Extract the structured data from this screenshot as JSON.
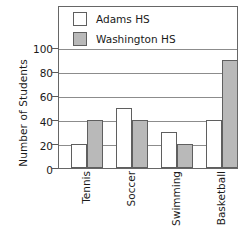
{
  "chart_data": {
    "type": "bar",
    "title": "",
    "subtitle": "",
    "xlabel": "",
    "ylabel": "Number of Students",
    "categories": [
      "Tennis",
      "Soccer",
      "Swimming",
      "Basketball"
    ],
    "series": [
      {
        "name": "Adams HS",
        "values": [
          20,
          50,
          30,
          40
        ],
        "color": "#ffffff"
      },
      {
        "name": "Washington HS",
        "values": [
          40,
          40,
          20,
          90
        ],
        "color": "#b9b9b9"
      }
    ],
    "ylim": [
      0,
      100
    ],
    "ytick_labels": [
      "0",
      "20",
      "40",
      "60",
      "80",
      "100"
    ],
    "ytick_values": [
      0,
      20,
      40,
      60,
      80,
      100
    ],
    "grid": true,
    "legend_position": "inside-top-left",
    "orientation": "vertical",
    "grouped": true
  },
  "axes": {
    "y_title": "Number of Students",
    "y_ticks": [
      {
        "label": "100",
        "value": 100
      },
      {
        "label": "80",
        "value": 80
      },
      {
        "label": "60",
        "value": 60
      },
      {
        "label": "40",
        "value": 40
      },
      {
        "label": "20",
        "value": 20
      },
      {
        "label": "0",
        "value": 0
      }
    ],
    "x_labels": [
      "Tennis",
      "Soccer",
      "Swimming",
      "Basketball"
    ]
  },
  "legend": {
    "entries": [
      {
        "label": "Adams HS",
        "swatch": "unfilled-square-swatch"
      },
      {
        "label": "Washington HS",
        "swatch": "filled-square-swatch"
      }
    ]
  },
  "colors": {
    "adams_fill": "#ffffff",
    "washington_fill": "#b9b9b9",
    "outline": "#5f5f5f",
    "frame": "#666666",
    "grid": "#8c8c8c",
    "text": "#1a1a1a"
  }
}
